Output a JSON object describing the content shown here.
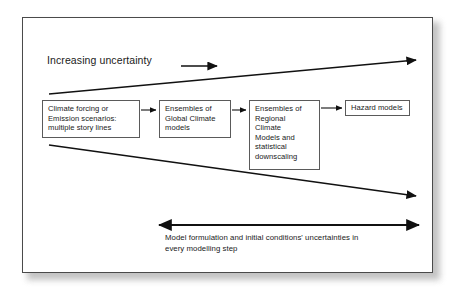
{
  "figure": {
    "title_label": "Increasing uncertainty",
    "colors": {
      "frame_border": "#4a4a4a",
      "box_border": "#5a5a5a",
      "text": "#1a1a1a",
      "arrow": "#111111",
      "background": "#ffffff",
      "shadow": "#b9b9b9"
    },
    "boxes": [
      {
        "name": "climate-forcing",
        "lines": [
          "Climate forcing or",
          "Emission scenarios:",
          "multiple story lines"
        ]
      },
      {
        "name": "global-climate-models",
        "lines": [
          "Ensembles of",
          "Global Climate",
          "models"
        ]
      },
      {
        "name": "regional-climate-models",
        "lines": [
          "Ensembles of",
          "Regional",
          "Climate",
          "Models and",
          "statistical",
          "downscaling"
        ]
      },
      {
        "name": "hazard-models",
        "lines": [
          "Hazard models"
        ]
      }
    ],
    "bottom_caption": {
      "line1": "Model formulation and initial conditions' uncertainties in",
      "line2": "every modelling step"
    },
    "annotations": {
      "increasing_uncertainty_arrow": "right-arrow",
      "upper_divergence_arrow": "diverging-up-right-arrow",
      "lower_divergence_arrow": "diverging-down-right-arrow",
      "bottom_double_arrow": "double-headed-horizontal-arrow"
    }
  }
}
